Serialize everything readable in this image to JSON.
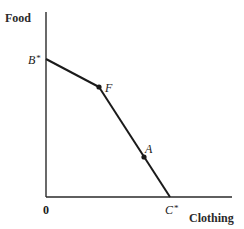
{
  "diagram": {
    "y_axis_label": "Food",
    "x_axis_label": "Clothing",
    "origin_label": "0",
    "points": {
      "B": {
        "label": "B",
        "suffix": "*",
        "x": 46,
        "y": 59
      },
      "F": {
        "label": "F",
        "x": 99,
        "y": 87
      },
      "A": {
        "label": "A",
        "x": 144,
        "y": 157
      },
      "C": {
        "label": "C",
        "suffix": "*",
        "x": 170,
        "y": 197
      }
    },
    "colors": {
      "line": "#1a1a1a",
      "axis": "#2a2a2a",
      "background": "#ffffff"
    }
  }
}
